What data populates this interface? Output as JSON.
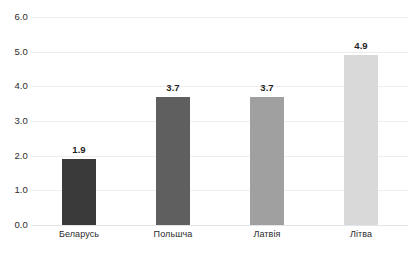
{
  "chart_data": {
    "type": "bar",
    "title": "",
    "subtitle": "",
    "xlabel": "",
    "ylabel": "",
    "categories": [
      "Беларусь",
      "Польшча",
      "Латвія",
      "Літва"
    ],
    "values": [
      1.9,
      3.7,
      3.7,
      4.9
    ],
    "value_labels": [
      "1.9",
      "3.7",
      "3.7",
      "4.9"
    ],
    "bar_colors": [
      "#3a3a3a",
      "#5f5f5f",
      "#a0a0a0",
      "#d9d9d9"
    ],
    "ylim": [
      0.0,
      6.0
    ],
    "ytick_step": 1.0,
    "ytick_labels": [
      "6.0",
      "5.0",
      "4.0",
      "3.0",
      "2.0",
      "1.0",
      "0.0"
    ],
    "ytick_values": [
      6.0,
      5.0,
      4.0,
      3.0,
      2.0,
      1.0,
      0.0
    ],
    "grid": true,
    "gridline_color": "#eceef0",
    "baseline_color": "#e2e4e7",
    "legend": false,
    "legend_position": "none",
    "background_color": "#ffffff",
    "text_color": "#262626"
  }
}
